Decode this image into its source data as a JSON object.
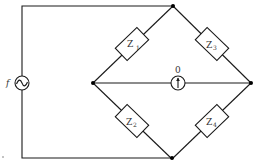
{
  "diagram": {
    "type": "wheatstone-bridge-ac",
    "source": {
      "label": "f",
      "symbol": "ac-source-icon"
    },
    "detector": {
      "label": "0",
      "symbol": "galvanometer-icon"
    },
    "impedances": [
      {
        "id": "Z1",
        "main": "Z",
        "sub": "1",
        "branch": "top-left"
      },
      {
        "id": "Z2",
        "main": "Z",
        "sub": "2",
        "branch": "bottom-left"
      },
      {
        "id": "Z3",
        "main": "Z",
        "sub": "3",
        "branch": "top-right"
      },
      {
        "id": "Z4",
        "main": "Z",
        "sub": "4",
        "branch": "bottom-right"
      }
    ],
    "nodes": [
      "top",
      "left",
      "right",
      "bottom"
    ]
  }
}
